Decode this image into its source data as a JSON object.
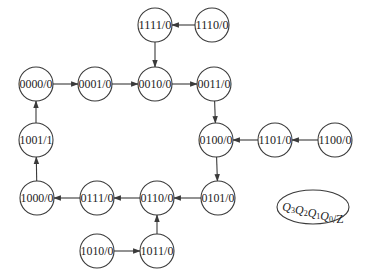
{
  "diagram": {
    "type": "state-transition-diagram",
    "states": [
      {
        "id": "s1111",
        "label": "1111/0",
        "cx": 155,
        "cy": 25
      },
      {
        "id": "s1110",
        "label": "1110/0",
        "cx": 212,
        "cy": 25
      },
      {
        "id": "s0000",
        "label": "0000/0",
        "cx": 36,
        "cy": 84
      },
      {
        "id": "s0001",
        "label": "0001/0",
        "cx": 95,
        "cy": 84
      },
      {
        "id": "s0010",
        "label": "0010/0",
        "cx": 155,
        "cy": 84
      },
      {
        "id": "s0011",
        "label": "0011/0",
        "cx": 214,
        "cy": 84
      },
      {
        "id": "s1001",
        "label": "1001/1",
        "cx": 36,
        "cy": 140
      },
      {
        "id": "s0100",
        "label": "0100/0",
        "cx": 216,
        "cy": 140
      },
      {
        "id": "s1101",
        "label": "1101/0",
        "cx": 275,
        "cy": 140
      },
      {
        "id": "s1100",
        "label": "1100/0",
        "cx": 335,
        "cy": 140
      },
      {
        "id": "s1000",
        "label": "1000/0",
        "cx": 37,
        "cy": 198
      },
      {
        "id": "s0111",
        "label": "0111/0",
        "cx": 97,
        "cy": 198
      },
      {
        "id": "s0110",
        "label": "0110/0",
        "cx": 157,
        "cy": 198
      },
      {
        "id": "s0101",
        "label": "0101/0",
        "cx": 218,
        "cy": 198
      },
      {
        "id": "s1010",
        "label": "1010/0",
        "cx": 97,
        "cy": 251
      },
      {
        "id": "s1011",
        "label": "1011/0",
        "cx": 157,
        "cy": 251
      }
    ],
    "transitions": [
      {
        "from": "s1110",
        "to": "s1111"
      },
      {
        "from": "s1111",
        "to": "s0010"
      },
      {
        "from": "s0000",
        "to": "s0001"
      },
      {
        "from": "s0001",
        "to": "s0010"
      },
      {
        "from": "s0010",
        "to": "s0011"
      },
      {
        "from": "s0011",
        "to": "s0100"
      },
      {
        "from": "s1100",
        "to": "s1101"
      },
      {
        "from": "s1101",
        "to": "s0100"
      },
      {
        "from": "s0100",
        "to": "s0101"
      },
      {
        "from": "s0101",
        "to": "s0110"
      },
      {
        "from": "s0110",
        "to": "s0111"
      },
      {
        "from": "s0111",
        "to": "s1000"
      },
      {
        "from": "s1000",
        "to": "s1001"
      },
      {
        "from": "s1001",
        "to": "s0000"
      },
      {
        "from": "s1010",
        "to": "s1011"
      },
      {
        "from": "s1011",
        "to": "s0110"
      }
    ],
    "legend": {
      "text": "Q3Q2Q1Q0/Z",
      "parts": [
        {
          "base": "Q",
          "sub": "3"
        },
        {
          "base": "Q",
          "sub": "2"
        },
        {
          "base": "Q",
          "sub": "1"
        },
        {
          "base": "Q",
          "sub": "0"
        }
      ],
      "suffix": "/Z",
      "cx": 313,
      "cy": 207,
      "rx": 36,
      "ry": 17
    },
    "radius": 17,
    "colors": {
      "stroke": "#3a3a3a",
      "text": "#222222",
      "background": "#ffffff"
    }
  }
}
